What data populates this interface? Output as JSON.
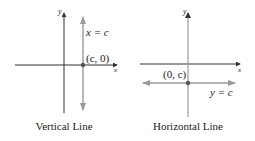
{
  "panels": [
    {
      "caption": "Vertical Line",
      "x_axis_label": "x",
      "y_axis_label": "y",
      "line_label": "x = c",
      "point_label": "(c, 0)"
    },
    {
      "caption": "Horizontal Line",
      "x_axis_label": "x",
      "y_axis_label": "y",
      "line_label": "y = c",
      "point_label": "(0, c)"
    }
  ],
  "colors": {
    "axis": "#333333",
    "line": "#9a9a9a",
    "point": "#555555",
    "text": "#222222"
  }
}
